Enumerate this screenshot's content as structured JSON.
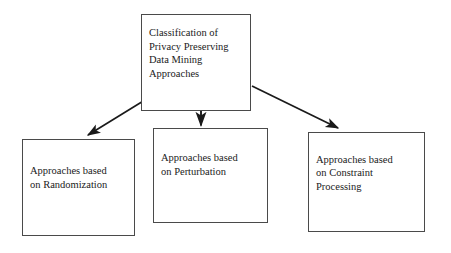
{
  "diagram": {
    "title": "Classification of Privacy Preserving Data Mining Approaches",
    "type": "tree-hierarchy",
    "background_color": "#ffffff",
    "border_color": "#4a4a4a",
    "text_color": "#1a1a1a",
    "nodes": {
      "root": {
        "id": "root",
        "label": "Classification of\nPrivacy Preserving\nData Mining\nApproaches",
        "lines": [
          "Classification of",
          "Privacy Preserving",
          "Data Mining",
          "Approaches"
        ]
      },
      "randomization": {
        "id": "randomization",
        "label": "Approaches based\non Randomization",
        "lines": [
          "Approaches based",
          "on Randomization"
        ]
      },
      "perturbation": {
        "id": "perturbation",
        "label": "Approaches based\non Perturbation",
        "lines": [
          "Approaches based",
          "on Perturbation"
        ]
      },
      "constraint": {
        "id": "constraint",
        "label": "Approaches based\non Constraint\nProcessing",
        "lines": [
          "Approaches based",
          "on Constraint",
          "Processing"
        ]
      }
    },
    "edges": [
      {
        "id": "root-to-randomization",
        "from": "root",
        "to": "randomization",
        "style": "solid-arrow"
      },
      {
        "id": "root-to-perturbation",
        "from": "root",
        "to": "perturbation",
        "style": "solid-arrow"
      },
      {
        "id": "root-to-constraint",
        "from": "root",
        "to": "constraint",
        "style": "solid-arrow"
      }
    ]
  }
}
